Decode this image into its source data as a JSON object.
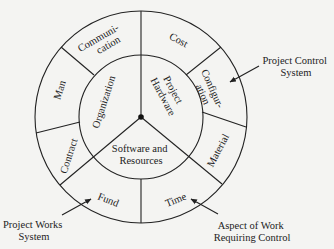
{
  "diagram": {
    "inner_segments": [
      {
        "label_lines": [
          "Organization"
        ]
      },
      {
        "label_lines": [
          "Project",
          "Hardware"
        ]
      },
      {
        "label_lines": [
          "Software and",
          "Resources"
        ]
      }
    ],
    "outer_segments": [
      {
        "label_lines": [
          "Communi-",
          "cation"
        ]
      },
      {
        "label_lines": [
          "Cost"
        ]
      },
      {
        "label_lines": [
          "Configur-",
          "ation"
        ]
      },
      {
        "label_lines": [
          "Material"
        ]
      },
      {
        "label_lines": [
          "Time"
        ]
      },
      {
        "label_lines": [
          "Fund"
        ]
      },
      {
        "label_lines": [
          "Contract"
        ]
      },
      {
        "label_lines": [
          "Man"
        ]
      }
    ],
    "callouts": {
      "project_control": [
        "Project Control",
        "System"
      ],
      "project_works": [
        "Project Works",
        "System"
      ],
      "aspect_of_work": [
        "Aspect of Work",
        "Requiring Control"
      ]
    }
  }
}
